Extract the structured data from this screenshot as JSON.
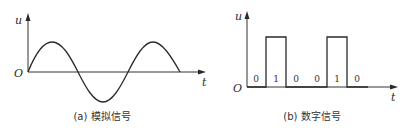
{
  "panels": [
    {
      "id": "analog",
      "caption": "(a) 模拟信号",
      "y_label": "u",
      "x_label": "t",
      "origin_label": "O",
      "waveform": "sine"
    },
    {
      "id": "digital",
      "caption": "(b) 数字信号",
      "y_label": "u",
      "x_label": "t",
      "origin_label": "O",
      "waveform": "square",
      "bits": [
        "0",
        "1",
        "0",
        "0",
        "1",
        "0"
      ]
    }
  ],
  "colors": {
    "line": "#2a2a2a",
    "background": "#ffffff"
  }
}
